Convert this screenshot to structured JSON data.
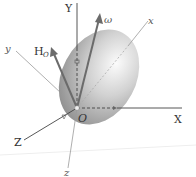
{
  "diagram": {
    "labels": {
      "Y": "Y",
      "X": "X",
      "Z": "Z",
      "x": "x",
      "y": "y",
      "z": "z",
      "origin": "O",
      "omega": "ω",
      "H": "H",
      "H_sub": "O"
    },
    "colors": {
      "body_light": "#e6e6e6",
      "body_dark": "#9a9a9a",
      "vector": "#6b6b6b",
      "axis": "#555555",
      "body_axis": "#9a9a9a"
    }
  }
}
